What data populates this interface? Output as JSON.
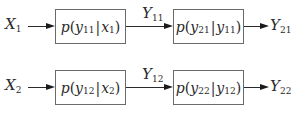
{
  "diagram": {
    "title": "",
    "rows": [
      {
        "input": {
          "base": "X",
          "sub": "1"
        },
        "box1": {
          "fn": "p",
          "num_var": "y",
          "num_sub": "11",
          "cond_var": "x",
          "cond_sub": "1"
        },
        "middle": {
          "base": "Y",
          "sub": "11"
        },
        "box2": {
          "fn": "p",
          "num_var": "y",
          "num_sub": "21",
          "cond_var": "y",
          "cond_sub": "11"
        },
        "output": {
          "base": "Y",
          "sub": "21"
        }
      },
      {
        "input": {
          "base": "X",
          "sub": "2"
        },
        "box1": {
          "fn": "p",
          "num_var": "y",
          "num_sub": "12",
          "cond_var": "x",
          "cond_sub": "2"
        },
        "middle": {
          "base": "Y",
          "sub": "12"
        },
        "box2": {
          "fn": "p",
          "num_var": "y",
          "num_sub": "22",
          "cond_var": "y",
          "cond_sub": "12"
        },
        "output": {
          "base": "Y",
          "sub": "22"
        }
      }
    ],
    "symbols": {
      "open_paren": "(",
      "close_paren": ")",
      "bar": "|"
    },
    "colors": {
      "stroke": "#2a2a2a",
      "box_border": "#6a6a6a",
      "background": "#ffffff"
    }
  }
}
